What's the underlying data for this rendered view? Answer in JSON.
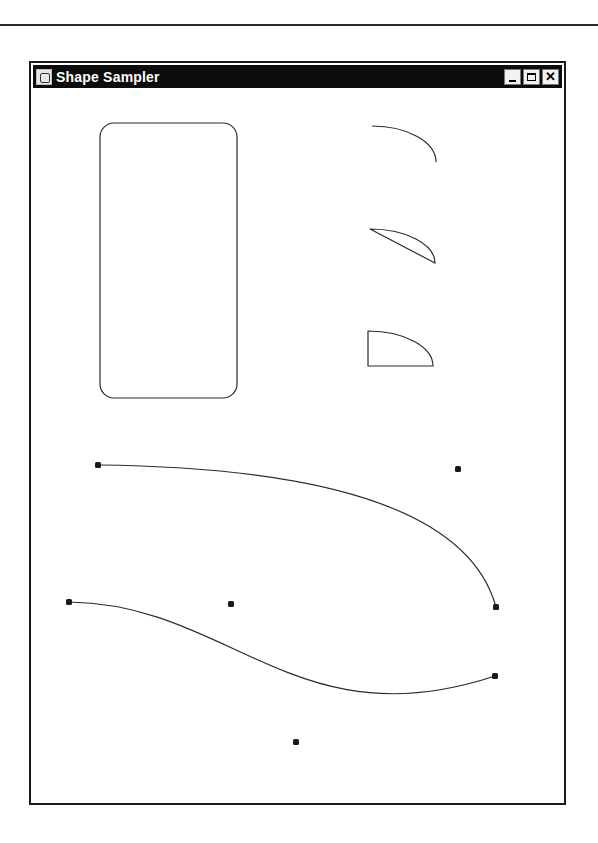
{
  "window": {
    "title": "Shape Sampler",
    "controls": {
      "minimize": "minimize",
      "maximize": "maximize",
      "close": "✕"
    }
  },
  "canvas": {
    "rounded_rectangle": {
      "x": 100,
      "y": 123,
      "width": 137,
      "height": 275,
      "rx": 14
    },
    "arc_open": {
      "start": [
        372,
        126
      ],
      "end": [
        436,
        162
      ]
    },
    "arc_chord": {
      "start": [
        370,
        229
      ],
      "end": [
        435,
        263
      ]
    },
    "arc_pie": {
      "start": [
        368,
        331
      ],
      "end": [
        433,
        366
      ],
      "center": [
        368,
        366
      ]
    },
    "quad_curve": {
      "start": [
        98,
        465
      ],
      "control": [
        458,
        469
      ],
      "end": [
        496,
        607
      ]
    },
    "cubic_curve": {
      "start": [
        69,
        602
      ],
      "control1": [
        231,
        604
      ],
      "control2": [
        296,
        742
      ],
      "end": [
        495,
        676
      ]
    }
  }
}
